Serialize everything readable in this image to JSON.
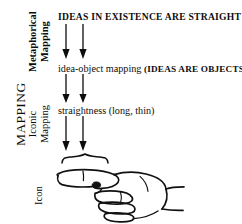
{
  "diagram": {
    "ink_color": "#0d0d0d",
    "background_color": "#ffffff",
    "left_axis": {
      "outer_label": "MAPPING",
      "levels": [
        {
          "id": "metaphorical",
          "line1": "Metaphorical",
          "line2": "Mapping",
          "bold": true
        },
        {
          "id": "iconic",
          "line1": "Iconic",
          "line2": "Mapping",
          "bold": false
        },
        {
          "id": "icon",
          "line1": "Icon",
          "line2": "",
          "bold": false
        }
      ]
    },
    "rows": [
      {
        "id": "row-top",
        "text": "IDEAS IN EXISTENCE ARE STRAIGHT",
        "style": "bold-caps"
      },
      {
        "id": "row-mid",
        "lead": "idea-object mapping ",
        "caps": "(IDEAS ARE OBJECTS)",
        "style": "mixed"
      },
      {
        "id": "row-low",
        "text": "straightness (long, thin)",
        "style": "plain"
      }
    ],
    "arrow_groups": [
      {
        "id": "arrows-1",
        "count": 2,
        "direction": "down"
      },
      {
        "id": "arrows-2",
        "count": 2,
        "direction": "down"
      },
      {
        "id": "arrows-3",
        "count": 2,
        "direction": "down"
      }
    ],
    "figure": {
      "id": "pointing-hand",
      "description": "line drawing of a hand pointing left with a curly brace over the extended index finger",
      "brace": "curly-brace-over-index-finger"
    }
  }
}
